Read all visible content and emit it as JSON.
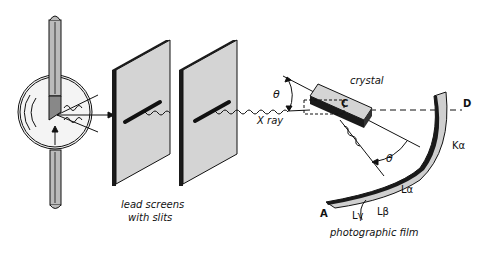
{
  "diagram": {
    "labels": {
      "lead_screens_line1": "lead screens",
      "lead_screens_line2": "with slits",
      "xray": "X ray",
      "crystal": "crystal",
      "crystal_point": "C",
      "theta_incident": "θ",
      "theta_reflected": "θ",
      "point_a": "A",
      "point_d": "D",
      "k_alpha": "Kα",
      "l_alpha": "Lα",
      "l_beta": "Lβ",
      "l_gamma": "Lγ",
      "film": "photographic film"
    },
    "components": [
      "x-ray tube",
      "lead screen 1",
      "lead screen 2",
      "crystal",
      "photographic film"
    ],
    "colors": {
      "ink": "#111111",
      "panel_face": "#d4d4d4",
      "panel_edge": "#1a1a1a",
      "film_face": "#cfcfcf",
      "background": "#ffffff"
    }
  }
}
